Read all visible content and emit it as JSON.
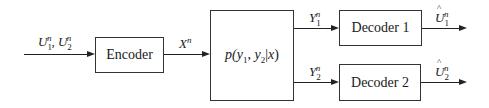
{
  "diagram": {
    "type": "block-diagram",
    "blocks": {
      "encoder": {
        "label": "Encoder"
      },
      "channel": {
        "label_parts": {
          "p": "p(",
          "y": "y",
          "s1": "1",
          "comma": ", ",
          "y2": "y",
          "s2": "2",
          "bar": "|",
          "x": "x",
          "close": ")"
        },
        "label": "p(y1, y2|x)"
      },
      "decoder1": {
        "label": "Decoder 1"
      },
      "decoder2": {
        "label": "Decoder 2"
      }
    },
    "signals": {
      "input": {
        "label": "U1^n, U2^n",
        "U": "U",
        "sub1": "1",
        "sup": "n",
        "sep": ", ",
        "sub2": "2"
      },
      "encoder_out": {
        "label": "X^n",
        "X": "X",
        "sup": "n"
      },
      "y1": {
        "label": "Y1^n",
        "Y": "Y",
        "sub": "1",
        "sup": "n"
      },
      "y2": {
        "label": "Y2^n",
        "Y": "Y",
        "sub": "2",
        "sup": "n"
      },
      "out1": {
        "label": "Û1^n",
        "U": "U",
        "sub": "1",
        "sup": "n"
      },
      "out2": {
        "label": "Û2^n",
        "U": "U",
        "sub": "2",
        "sup": "n"
      }
    },
    "colors": {
      "stroke": "#222222",
      "background": "#ffffff"
    }
  }
}
